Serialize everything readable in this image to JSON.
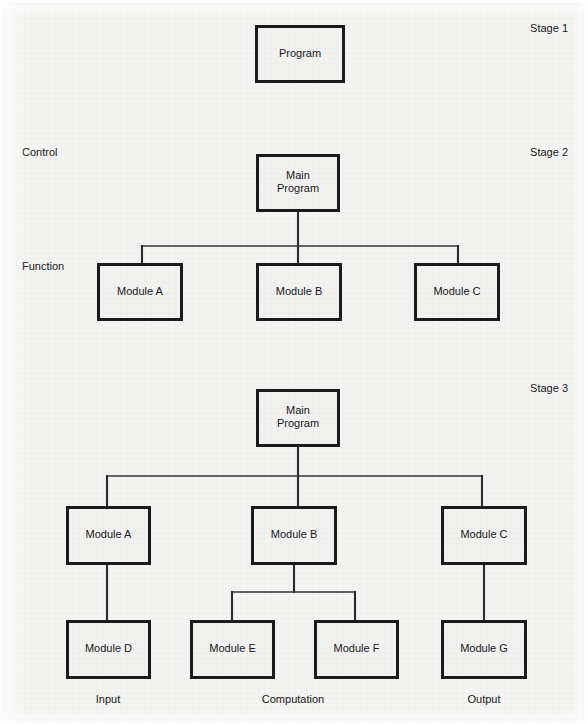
{
  "page": {
    "width": 587,
    "height": 724,
    "background_color": "#f4f4f2",
    "box_fill_color": "#f2f2f0",
    "box_border_color": "#1b1b1b",
    "connector_color": "#34343a",
    "text_color": "#17171a"
  },
  "stage_labels": [
    {
      "text": "Stage 1",
      "x": 568,
      "y": 32
    },
    {
      "text": "Stage 2",
      "x": 568,
      "y": 156
    },
    {
      "text": "Stage 3",
      "x": 568,
      "y": 392
    }
  ],
  "side_labels": [
    {
      "text": "Control",
      "x": 22,
      "y": 156
    },
    {
      "text": "Function",
      "x": 22,
      "y": 270
    }
  ],
  "footer_labels": [
    {
      "text": "Input",
      "x": 108,
      "y": 703
    },
    {
      "text": "Computation",
      "x": 293,
      "y": 703
    },
    {
      "text": "Output",
      "x": 484,
      "y": 703
    }
  ],
  "nodes": [
    {
      "id": "s1-program",
      "stage": 1,
      "lines": [
        "Program"
      ],
      "x": 255,
      "y": 25,
      "w": 90,
      "h": 58
    },
    {
      "id": "s2-main",
      "stage": 2,
      "lines": [
        "Main",
        "Program"
      ],
      "x": 256,
      "y": 154,
      "w": 84,
      "h": 58
    },
    {
      "id": "s2-module-a",
      "stage": 2,
      "lines": [
        "Module A"
      ],
      "x": 97,
      "y": 263,
      "w": 86,
      "h": 58
    },
    {
      "id": "s2-module-b",
      "stage": 2,
      "lines": [
        "Module B"
      ],
      "x": 256,
      "y": 263,
      "w": 86,
      "h": 58
    },
    {
      "id": "s2-module-c",
      "stage": 2,
      "lines": [
        "Module C"
      ],
      "x": 414,
      "y": 263,
      "w": 86,
      "h": 58
    },
    {
      "id": "s3-main",
      "stage": 3,
      "lines": [
        "Main",
        "Program"
      ],
      "x": 256,
      "y": 389,
      "w": 84,
      "h": 58
    },
    {
      "id": "s3-module-a",
      "stage": 3,
      "lines": [
        "Module A"
      ],
      "x": 66,
      "y": 506,
      "w": 85,
      "h": 59
    },
    {
      "id": "s3-module-b",
      "stage": 3,
      "lines": [
        "Module B"
      ],
      "x": 251,
      "y": 506,
      "w": 86,
      "h": 59
    },
    {
      "id": "s3-module-c",
      "stage": 3,
      "lines": [
        "Module C"
      ],
      "x": 441,
      "y": 506,
      "w": 86,
      "h": 59
    },
    {
      "id": "s3-module-d",
      "stage": 3,
      "lines": [
        "Module D"
      ],
      "x": 66,
      "y": 620,
      "w": 85,
      "h": 59
    },
    {
      "id": "s3-module-e",
      "stage": 3,
      "lines": [
        "Module E"
      ],
      "x": 190,
      "y": 620,
      "w": 85,
      "h": 59
    },
    {
      "id": "s3-module-f",
      "stage": 3,
      "lines": [
        "Module F"
      ],
      "x": 314,
      "y": 620,
      "w": 85,
      "h": 59
    },
    {
      "id": "s3-module-g",
      "stage": 3,
      "lines": [
        "Module G"
      ],
      "x": 441,
      "y": 620,
      "w": 86,
      "h": 59
    }
  ],
  "connectors": [
    {
      "id": "s2-main-drop",
      "points": "298,212 298,263"
    },
    {
      "id": "s2-bus",
      "points": "142,246 458,246"
    },
    {
      "id": "s2-drop-a",
      "points": "142,246 142,263"
    },
    {
      "id": "s2-drop-c",
      "points": "458,246 458,263"
    },
    {
      "id": "s3-main-drop",
      "points": "298,447 298,506"
    },
    {
      "id": "s3-bus",
      "points": "107,476 482,476"
    },
    {
      "id": "s3-drop-a",
      "points": "107,476 107,506"
    },
    {
      "id": "s3-drop-c",
      "points": "482,476 482,506"
    },
    {
      "id": "s3-a-to-d",
      "points": "107,565 107,620"
    },
    {
      "id": "s3-c-to-g",
      "points": "484,565 484,620"
    },
    {
      "id": "s3-b-drop",
      "points": "294,565 294,592"
    },
    {
      "id": "s3-b-bus",
      "points": "232,592 355,592"
    },
    {
      "id": "s3-drop-e",
      "points": "232,592 232,620"
    },
    {
      "id": "s3-drop-f",
      "points": "355,592 355,620"
    }
  ],
  "page_frame": {
    "x": 4,
    "y": 4,
    "w": 579,
    "h": 716
  }
}
